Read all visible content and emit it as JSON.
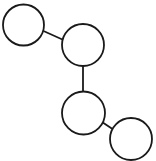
{
  "diagram": {
    "type": "graph",
    "background": "#ffffff",
    "stroke_color": "#1a1a1a",
    "nodes": [
      {
        "id": "node-1",
        "cx": 23.5,
        "cy": 25,
        "r": 20.5,
        "label": ""
      },
      {
        "id": "node-2",
        "cx": 83,
        "cy": 45,
        "r": 21,
        "label": ""
      },
      {
        "id": "node-3",
        "cx": 83.5,
        "cy": 113,
        "r": 21.5,
        "label": ""
      },
      {
        "id": "node-4",
        "cx": 131,
        "cy": 139,
        "r": 21,
        "label": ""
      }
    ],
    "edges": [
      {
        "from": "node-1",
        "to": "node-2",
        "x1": 43.5,
        "y1": 31,
        "x2": 63.5,
        "y2": 40
      },
      {
        "from": "node-2",
        "to": "node-3",
        "x1": 83,
        "y1": 66,
        "x2": 83,
        "y2": 91.5
      },
      {
        "from": "node-3",
        "to": "node-4",
        "x1": 102,
        "y1": 122,
        "x2": 112.5,
        "y2": 129
      }
    ]
  }
}
